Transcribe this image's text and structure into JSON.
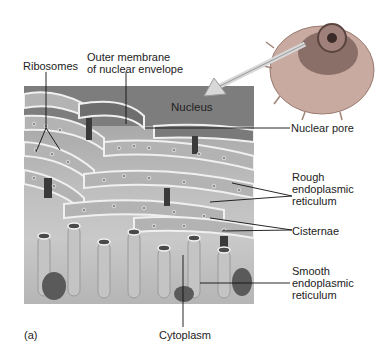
{
  "figure": {
    "panel_letter": "(a)",
    "inset": "cell-with-nucleus-icon",
    "labels": {
      "ribosomes": "Ribosomes",
      "outer_membrane_line1": "Outer membrane",
      "outer_membrane_line2": "of nuclear envelope",
      "nucleus": "Nucleus",
      "nuclear_pore": "Nuclear pore",
      "rough_er_line1": "Rough",
      "rough_er_line2": "endoplasmic",
      "rough_er_line3": "reticulum",
      "cisternae": "Cisternae",
      "smooth_er_line1": "Smooth",
      "smooth_er_line2": "endoplasmic",
      "smooth_er_line3": "reticulum",
      "cytoplasm": "Cytoplasm"
    },
    "colors": {
      "background": "#ffffff",
      "panel_dark": "#5a5a5a",
      "panel_mid": "#a9a9a9",
      "panel_light": "#d4d4d4",
      "leader_line": "#111111",
      "inset_cell": "#b89a8a"
    }
  }
}
